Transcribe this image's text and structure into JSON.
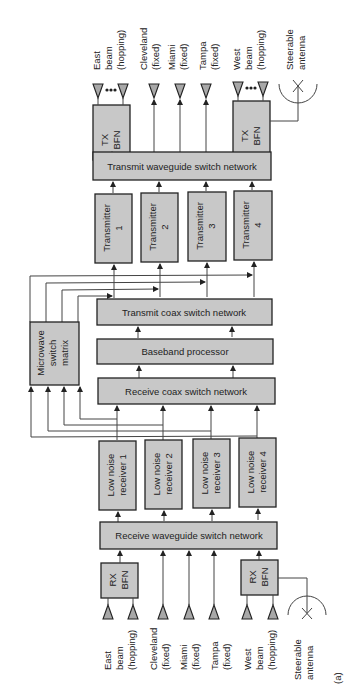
{
  "diagram": {
    "figure_label": "(a)",
    "orientation": "rotated 90 degrees counter-clockwise (text reads bottom-to-top)",
    "top_antennas": [
      {
        "id": "east",
        "lines": [
          "East",
          "beam",
          "(hopping)"
        ]
      },
      {
        "id": "cleveland",
        "lines": [
          "Cleveland",
          "(fixed)"
        ]
      },
      {
        "id": "miami",
        "lines": [
          "Miami",
          "(fixed)"
        ]
      },
      {
        "id": "tampa",
        "lines": [
          "Tampa",
          "(fixed)"
        ]
      },
      {
        "id": "west",
        "lines": [
          "West",
          "beam",
          "(hopping)"
        ]
      },
      {
        "id": "steerable",
        "lines": [
          "Steerable",
          "antenna"
        ]
      }
    ],
    "bottom_antennas": [
      {
        "id": "east",
        "lines": [
          "East",
          "beam",
          "(hopping)"
        ]
      },
      {
        "id": "cleveland",
        "lines": [
          "Cleveland",
          "(fixed)"
        ]
      },
      {
        "id": "miami",
        "lines": [
          "Miami",
          "(fixed)"
        ]
      },
      {
        "id": "tampa",
        "lines": [
          "Tampa",
          "(fixed)"
        ]
      },
      {
        "id": "west",
        "lines": [
          "West",
          "beam",
          "(hopping)"
        ]
      },
      {
        "id": "steerable",
        "lines": [
          "Steerable",
          "antenna"
        ]
      }
    ],
    "blocks": {
      "tx_bfn_east": [
        "TX",
        "BFN"
      ],
      "tx_bfn_west": [
        "TX",
        "BFN"
      ],
      "transmit_waveguide": "Transmit waveguide switch network",
      "transmitters": [
        [
          "Transmitter",
          "1"
        ],
        [
          "Transmitter",
          "2"
        ],
        [
          "Transmitter",
          "3"
        ],
        [
          "Transmitter",
          "4"
        ]
      ],
      "transmit_coax": "Transmit coax switch network",
      "baseband": "Baseband processor",
      "receive_coax": "Receive coax switch network",
      "microwave_matrix": [
        "Microwave",
        "switch",
        "matrix"
      ],
      "low_noise_receivers": [
        [
          "Low noise",
          "receiver 1"
        ],
        [
          "Low noise",
          "receiver 2"
        ],
        [
          "Low noise",
          "receiver 3"
        ],
        [
          "Low noise",
          "receiver 4"
        ]
      ],
      "receive_waveguide": "Receive waveguide switch network",
      "rx_bfn_east": [
        "RX",
        "BFN"
      ],
      "rx_bfn_west": [
        "RX",
        "BFN"
      ]
    }
  }
}
